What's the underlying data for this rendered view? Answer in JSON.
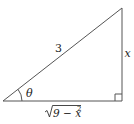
{
  "figure": {
    "type": "right-triangle",
    "vertices": {
      "angle_vertex": [
        3,
        101
      ],
      "right_angle_vertex": [
        122,
        101
      ],
      "top_vertex": [
        122,
        8
      ]
    },
    "stroke_color": "#555555",
    "right_angle_marker_size": 7,
    "labels": {
      "hypotenuse": "3",
      "opposite": "x",
      "adjacent_radicand": "9 − x",
      "adjacent_exponent": "2",
      "angle": "θ"
    }
  }
}
